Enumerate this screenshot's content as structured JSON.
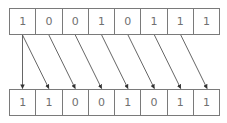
{
  "diagram": {
    "top_row": [
      "1",
      "0",
      "0",
      "1",
      "0",
      "1",
      "1",
      "1"
    ],
    "bottom_row": [
      "1",
      "1",
      "0",
      "0",
      "1",
      "0",
      "1",
      "1"
    ],
    "arrows": [
      {
        "from_top": 0,
        "to_bottom": 0
      },
      {
        "from_top": 0,
        "to_bottom": 1
      },
      {
        "from_top": 1,
        "to_bottom": 2
      },
      {
        "from_top": 2,
        "to_bottom": 3
      },
      {
        "from_top": 3,
        "to_bottom": 4
      },
      {
        "from_top": 4,
        "to_bottom": 5
      },
      {
        "from_top": 5,
        "to_bottom": 6
      },
      {
        "from_top": 6,
        "to_bottom": 7
      }
    ],
    "colors": {
      "border": "#7a7a7a",
      "text": "#707070",
      "arrow": "#444444"
    }
  }
}
